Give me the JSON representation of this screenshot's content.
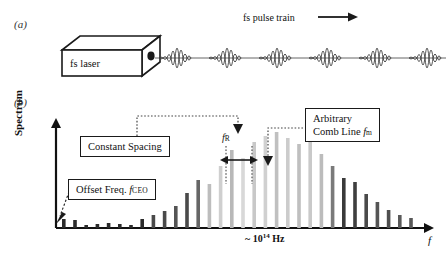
{
  "figure": {
    "panel_a_label": "(a)",
    "panel_b_label": "(b)"
  },
  "panel_a": {
    "laser_label": "fs laser",
    "pulse_train_label": "fs pulse train",
    "arrow_icon": "right-arrow-icon",
    "pulse_count": 6
  },
  "panel_b": {
    "y_axis_label": "Spectrum",
    "x_axis_label": "f",
    "x_axis_scale_text": "~ 10",
    "x_axis_scale_exponent": "14",
    "x_axis_scale_unit": "Hz",
    "annotations": {
      "constant_spacing": "Constant Spacing",
      "offset_freq_text": "Offset Freq.",
      "offset_freq_symbol": "f",
      "offset_freq_subscript": "CEO",
      "arbitrary_line1": "Arbitrary",
      "arbitrary_line2": "Comb Line",
      "arbitrary_symbol": "f",
      "arbitrary_subscript": "m",
      "repetition_symbol": "f",
      "repetition_subscript": "R"
    }
  },
  "chart_data": {
    "type": "bar",
    "xlabel": "f",
    "ylabel": "Spectrum",
    "x_tick_labels": [
      "~ 10^14 Hz"
    ],
    "grid": false,
    "legend": "none",
    "ylim": [
      0,
      100
    ],
    "note": "Comb teeth equally spaced by f_R, offset from zero by f_CEO; envelope peaks near center.",
    "categories": [
      1,
      2,
      3,
      4,
      5,
      6,
      7,
      8,
      9,
      10,
      11,
      12,
      13,
      14,
      15,
      16,
      17,
      18,
      19,
      20,
      21,
      22,
      23,
      24,
      25,
      26,
      27,
      28,
      29,
      30,
      31,
      32
    ],
    "values": [
      9,
      8,
      3,
      4,
      5,
      4,
      3,
      9,
      13,
      17,
      22,
      35,
      48,
      44,
      62,
      78,
      70,
      86,
      92,
      96,
      90,
      84,
      88,
      74,
      62,
      50,
      46,
      34,
      26,
      18,
      13,
      10
    ],
    "bar_colors": [
      "#2b2b2b",
      "#2b2b2b",
      "#2b2b2b",
      "#2b2b2b",
      "#2b2b2b",
      "#2b2b2b",
      "#2b2b2b",
      "#2b2b2b",
      "#4a4a4a",
      "#4a4a4a",
      "#555555",
      "#4a4a4a",
      "#666666",
      "#bdbdbd",
      "#cfcfcf",
      "#b8b8b8",
      "#d8d8d8",
      "#c8c8c8",
      "#d0d0d0",
      "#c0c0c0",
      "#cccccc",
      "#bfbfbf",
      "#c9c9c9",
      "#bcbcbc",
      "#7a7a7a",
      "#3a3a3a",
      "#3f3f3f",
      "#4a4a4a",
      "#555555",
      "#4f4f4f",
      "#5a5a5a",
      "#585858"
    ]
  }
}
